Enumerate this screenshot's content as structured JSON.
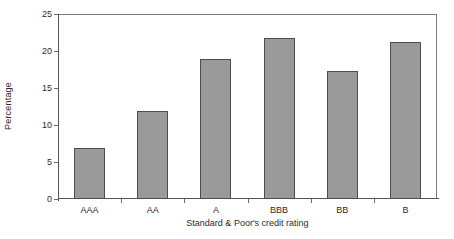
{
  "chart_data": {
    "type": "bar",
    "title": "",
    "subtitle": "",
    "categories": [
      "AAA",
      "AA",
      "A",
      "BBB",
      "BB",
      "B"
    ],
    "values": [
      6.9,
      11.9,
      18.9,
      21.8,
      17.3,
      21.2
    ],
    "xlabel": "Standard & Poor's credit rating",
    "ylabel": "Percentage",
    "ylim": [
      0,
      25
    ],
    "yticks": [
      0,
      5,
      10,
      15,
      20,
      25
    ],
    "ytick_labels": [
      "0",
      "5",
      "10",
      "15",
      "20",
      "25"
    ],
    "grid": false,
    "legend": false,
    "legend_position": "none",
    "bar_color": "#9a9a9a",
    "bar_edge_color": "#4d4d4d",
    "axis_color": "#555555",
    "background_color": "#ffffff"
  }
}
